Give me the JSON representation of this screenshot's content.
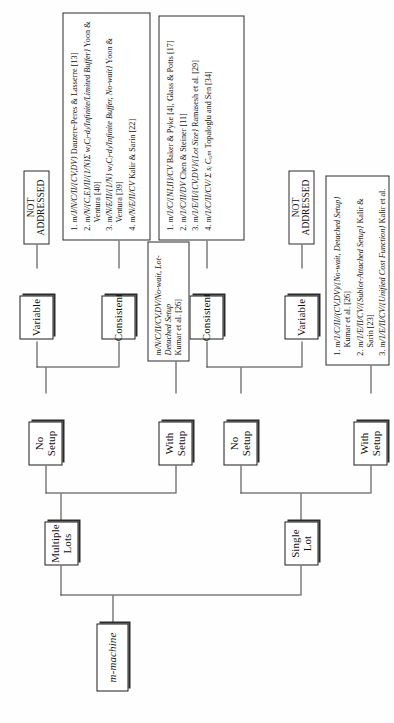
{
  "diagram": {
    "orientation": "rotated-90",
    "root": {
      "label": "m-machine"
    },
    "level1": [
      {
        "label": "Single Lot"
      },
      {
        "label": "Multiple Lots"
      }
    ],
    "level2": [
      {
        "label": "With Setup"
      },
      {
        "label": "No Setup"
      },
      {
        "label": "With Setup"
      },
      {
        "label": "No Setup"
      }
    ],
    "level3": [
      {
        "label": "Variable"
      },
      {
        "label": "Consistent"
      },
      {
        "label": "Variable"
      },
      {
        "label": "Consistent"
      }
    ],
    "not_addressed_single": "NOT ADDRESSED",
    "not_addressed_multiple": "NOT ADDRESSED"
  },
  "boxes": {
    "single_with_setup": {
      "name": "single-lot-with-setup-references",
      "items": [
        {
          "code": "m/1/C/II//(CV,DV)/{No-wait, Detached Setup}",
          "cite": "Kumar et al. [26]"
        },
        {
          "code": "m/1/E/II/CV/{Sublot-Attached Setup}",
          "cite": "Kalir & Sarin [23]"
        },
        {
          "code": "m/1/E/II/CV/{Unified Cost Function}",
          "cite": "Kalir et al. [25]"
        }
      ]
    },
    "single_no_setup_consistent": {
      "name": "single-lot-no-setup-consistent-references",
      "items": [
        {
          "code": "m/1/C/{NI,II}/CV",
          "cite": "Baker & Pyke [4], Glass & Potts [17]"
        },
        {
          "code": "m/1/C/II/DV",
          "cite": "Chen & Steiner [11]"
        },
        {
          "code": "m/1/E/II/{CV,DV}/{Lot Size}",
          "cite": "Ramasesh et al. [29]"
        },
        {
          "code": "m/1/C/II/CV/ Σ sᵢ Cₒᵢₘ",
          "cite": "Topaloglu and Sen [34]"
        }
      ]
    },
    "multiple_with_setup": {
      "name": "multiple-lots-with-setup-reference",
      "code": "m/N/C/II/CV,DV/No-wait, Lot-Detached Setup",
      "cite": "Kumar et al. [26]"
    },
    "multiple_no_setup_consistent": {
      "name": "multiple-lots-no-setup-consistent-references",
      "items": [
        {
          "code": "m/J/N/C/II/{CV,DV}",
          "cite": "Dauzere-Peres & Lasserre [13]"
        },
        {
          "code": "m/N/{C,E}/II/{1/N}Σ wⱼCⱼ-dⱼ/Infinite/Limited Buffer}",
          "cite": "Yoon & Ventura [40]"
        },
        {
          "code": "m/N/E/II/{1/N} wⱼCⱼ-dⱼ/Infinite Buffer, No-wait}",
          "cite": "Yoon & Ventura [39]"
        },
        {
          "code": "m/N/E/II/CV",
          "cite": "Kalir & Sarin [22]"
        }
      ]
    }
  }
}
